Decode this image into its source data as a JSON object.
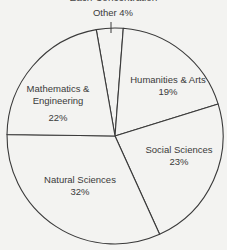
{
  "chart_data": {
    "type": "pie",
    "title": "Each Concentration",
    "categories": [
      "Other",
      "Humanities & Arts",
      "Social Sciences",
      "Natural Sciences",
      "Mathematics & Engineering"
    ],
    "values": [
      4,
      19,
      23,
      32,
      22
    ],
    "unit": "%",
    "start_angle_deg": -10,
    "direction": "clockwise",
    "legend": "none (labels inside slices; Other labeled outside with leader tick)",
    "colors": {
      "fill": "#f3f3f1",
      "stroke": "#3a3a3a",
      "text": "#3a3a3a"
    }
  },
  "labels": {
    "other": {
      "name": "Other",
      "pct": "4%",
      "full": "Other 4%"
    },
    "humanities": {
      "name": "Humanities & Arts",
      "pct": "19%"
    },
    "social": {
      "name": "Social Sciences",
      "pct": "23%"
    },
    "natural": {
      "name": "Natural Sciences",
      "pct": "32%"
    },
    "math": {
      "name_line1": "Mathematics &",
      "name_line2": "Engineering",
      "pct": "22%"
    }
  }
}
